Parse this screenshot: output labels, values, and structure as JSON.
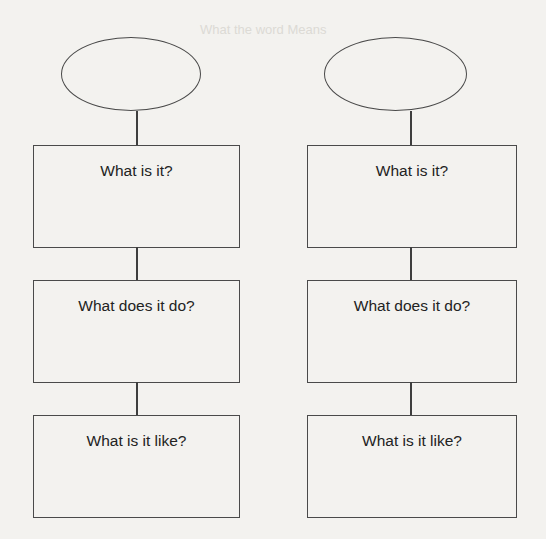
{
  "background_bleed_text": "What the word Means",
  "columns": [
    {
      "ellipse_text": "",
      "boxes": [
        {
          "label": "What is it?"
        },
        {
          "label": "What does it do?"
        },
        {
          "label": "What is it like?"
        }
      ]
    },
    {
      "ellipse_text": "",
      "boxes": [
        {
          "label": "What is it?"
        },
        {
          "label": "What does it do?"
        },
        {
          "label": "What is it like?"
        }
      ]
    }
  ]
}
